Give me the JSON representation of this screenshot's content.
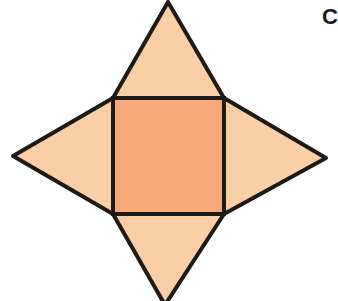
{
  "diagram": {
    "type": "net-of-square-pyramid",
    "option_label": "C",
    "colors": {
      "base_square": "#f6a878",
      "triangle_faces": "#fbcfa6",
      "stroke": "#1e1a18"
    },
    "base_square": {
      "x1": 113,
      "y1": 98,
      "x2": 224,
      "y2": 214
    },
    "apexes": {
      "top": [
        168,
        2
      ],
      "left": [
        13,
        156
      ],
      "right": [
        326,
        158
      ],
      "bottom": [
        165,
        301
      ]
    }
  }
}
